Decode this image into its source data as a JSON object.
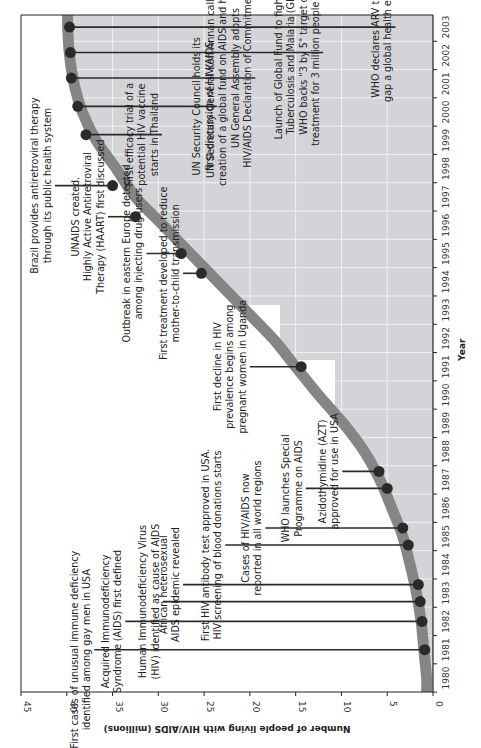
{
  "chart_data": {
    "type": "line",
    "orientation": "rotated-90-clockwise",
    "title": "",
    "xlabel": "Year",
    "ylabel": "Number of people living with HIV/AIDS (millions)",
    "xlim": [
      1980,
      2003
    ],
    "ylim": [
      0,
      45
    ],
    "x_ticks": [
      "1980",
      "1981",
      "1982",
      "1983",
      "1984",
      "1985",
      "1986",
      "1987",
      "1988",
      "1989",
      "1990",
      "1991",
      "1992",
      "1993",
      "1994",
      "1995",
      "1996",
      "1997",
      "1998",
      "1999",
      "2000",
      "2001",
      "2002",
      "2003"
    ],
    "y_ticks": [
      0,
      5,
      10,
      15,
      20,
      25,
      30,
      35,
      40,
      45
    ],
    "grid": true,
    "series": [
      {
        "name": "People living with HIV/AIDS (millions)",
        "x": [
          1980,
          1981,
          1982,
          1983,
          1984,
          1985,
          1986,
          1987,
          1988,
          1989,
          1990,
          1991,
          1992,
          1993,
          1994,
          1995,
          1996,
          1997,
          1998,
          1999,
          2000,
          2001,
          2002,
          2003
        ],
        "values": [
          0.7,
          1.0,
          1.3,
          1.8,
          2.5,
          3.3,
          4.5,
          5.8,
          7.5,
          9.8,
          12.5,
          15.0,
          17.5,
          20.5,
          23.5,
          26.5,
          29.5,
          32.5,
          34.6,
          36.8,
          38.3,
          39.2,
          39.7,
          39.9
        ]
      }
    ],
    "events": [
      {
        "year": 1981.0,
        "value": 0.9,
        "label_end": 37.0,
        "lines": [
          "First cases of unusual immune deficiency",
          "identified among gay men in USA"
        ]
      },
      {
        "year": 1982.0,
        "value": 1.2,
        "label_end": 33.6,
        "lines": [
          "Acquired Immunodeficiency",
          "Syndrome (AIDS) first defined"
        ]
      },
      {
        "year": 1982.7,
        "value": 1.4,
        "label_end": 29.5,
        "lines": [
          "Human Immunodeficiency Virus",
          "(HIV) identified as cause of AIDS"
        ]
      },
      {
        "year": 1983.3,
        "value": 1.6,
        "label_end": 27.3,
        "lines": [
          "African heterosexual",
          "AIDS epidemic revealed"
        ]
      },
      {
        "year": 1984.7,
        "value": 2.7,
        "label_end": 22.7,
        "lines": [
          "First HIV antibody test approved in USA.",
          "HIV screening of blood donations starts"
        ]
      },
      {
        "year": 1985.3,
        "value": 3.3,
        "label_end": 18.3,
        "lines": [
          "Cases of HIV/AIDS now",
          "reported in all world regions"
        ]
      },
      {
        "year": 1986.7,
        "value": 5.0,
        "label_end": 13.9,
        "lines": [
          "WHO launches Special",
          "Programme on AIDS"
        ]
      },
      {
        "year": 1987.3,
        "value": 5.9,
        "label_end": 9.9,
        "lines": [
          "Azidothymidine (AZT)",
          "approved for use in USA"
        ]
      },
      {
        "year": 1991.0,
        "value": 14.4,
        "label_end": 20.0,
        "lines": [
          "First decline in HIV",
          "prevalence begins among",
          "pregnant women in Uganda"
        ]
      },
      {
        "year": 1994.3,
        "value": 25.3,
        "label_end": 27.3,
        "lines": [
          "First treatment developed to reduce",
          "mother-to-child transmission"
        ]
      },
      {
        "year": 1995.0,
        "value": 27.5,
        "label_end": 31.3,
        "lines": [
          "Outbreak in eastern Europe detected",
          "among injecting drug users"
        ]
      },
      {
        "year": 1996.3,
        "value": 32.5,
        "label_end": 35.5,
        "lines": [
          "UNAIDS created.",
          "Highly Active Antiretroviral",
          "Therapy (HAART) first discussed"
        ]
      },
      {
        "year": 1997.4,
        "value": 35.0,
        "label_end": 41.3,
        "lines": [
          "Brazil provides antiretroviral therapy",
          "through its public health system"
        ]
      },
      {
        "year": 1999.2,
        "value": 37.9,
        "label_end": 29.6,
        "lines": [
          "First efficacy trial of a",
          "potential HIV vaccine",
          "starts in Thailand"
        ]
      },
      {
        "year": 2000.2,
        "value": 38.8,
        "label_end": 23.6,
        "lines": [
          "UN Security Council holds its",
          "first discussion of HIV/AIDS"
        ]
      },
      {
        "year": 2001.2,
        "value": 39.5,
        "label_end": 19.4,
        "lines": [
          "UN Secretary-General Kofi Annan calls for",
          "creation of a global fund on AIDS and health.",
          "UN General Assembly adopts",
          "HIV/AIDS Declaration of Commitment"
        ]
      },
      {
        "year": 2002.1,
        "value": 39.6,
        "label_end": 12.0,
        "lines": [
          "Launch of Global Fund to fight AIDS,",
          "Tuberculosis and Malaria (GFATM).",
          "WHO backs \"3 by 5\" target or ARV",
          "treatment for 3 million people by 2005"
        ]
      },
      {
        "year": 2003.0,
        "value": 39.7,
        "label_end": 4.1,
        "lines": [
          "WHO declares ARV treatment",
          "gap a global health emergency"
        ]
      }
    ],
    "colors": {
      "area_fill": "#d4d4d8",
      "curve_band": "#858585",
      "dot": "#2a2a2a",
      "leader_line": "#2a2a2a",
      "grid": "#f2f2f2",
      "axis": "#222222"
    }
  }
}
